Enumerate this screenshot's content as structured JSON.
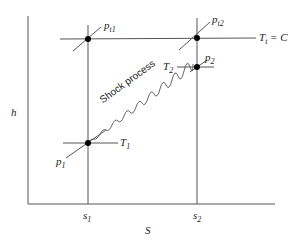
{
  "diagram": {
    "type": "h-s diagram",
    "axes": {
      "y_label": "h",
      "x_label": "S",
      "x_ticks": [
        "s1",
        "s2"
      ]
    },
    "lines": {
      "stagnation_temperature": "T_t = C"
    },
    "process_label": "Shock process",
    "points": {
      "pt1": "p_t1",
      "pt2": "p_t2",
      "p1": "p_1",
      "p2": "p_2",
      "T1": "T_1",
      "T2": "T_2"
    }
  },
  "labels": {
    "h": "h",
    "S": "S",
    "s": "s",
    "sub1": "1",
    "sub2": "2",
    "p": "p",
    "t1": "t1",
    "t2": "t2",
    "T": "T",
    "Tt_sub": "t",
    "eqC": " = C",
    "shock": "Shock process"
  }
}
